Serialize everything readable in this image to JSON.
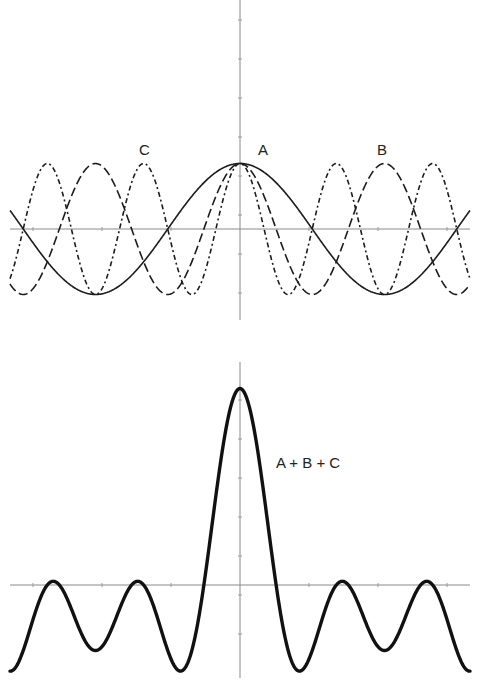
{
  "chart_data": [
    {
      "type": "line",
      "title": "",
      "description": "Three cosine components with frequencies 1, 2 and 3, all peaking together at x = 0",
      "xlabel": "",
      "ylabel": "",
      "xlim": [
        -5.0,
        5.0
      ],
      "ylim": [
        -1,
        1
      ],
      "grid": false,
      "legend": "inline labels",
      "series": [
        {
          "name": "A",
          "label": "A",
          "function": "cos(x)",
          "frequency": 1,
          "amplitude": 1,
          "style": "solid"
        },
        {
          "name": "B",
          "label": "B",
          "function": "cos(2x)",
          "frequency": 2,
          "amplitude": 1,
          "style": "long-dash"
        },
        {
          "name": "C",
          "label": "C",
          "function": "cos(3x)",
          "frequency": 3,
          "amplitude": 1,
          "style": "dash-dot"
        }
      ],
      "annotations": [
        {
          "text": "A",
          "near": "central peak"
        },
        {
          "text": "B",
          "near": "right peak of B"
        },
        {
          "text": "C",
          "near": "left peak of C"
        }
      ]
    },
    {
      "type": "line",
      "title": "",
      "description": "Sum of the three components, showing a tall central peak and smaller side lobes",
      "xlabel": "",
      "ylabel": "",
      "xlim": [
        -5.0,
        5.0
      ],
      "ylim": [
        -1.3,
        3
      ],
      "grid": false,
      "series": [
        {
          "name": "A + B + C",
          "label": "A + B + C",
          "function": "cos(x) + cos(2x) + cos(3x)",
          "style": "solid-bold",
          "max": 3,
          "min": -1.28
        }
      ],
      "annotations": [
        {
          "text": "A + B + C",
          "near": "right of central peak"
        }
      ]
    }
  ],
  "labels": {
    "a": "A",
    "b": "B",
    "c": "C",
    "sum": "A + B + C"
  }
}
